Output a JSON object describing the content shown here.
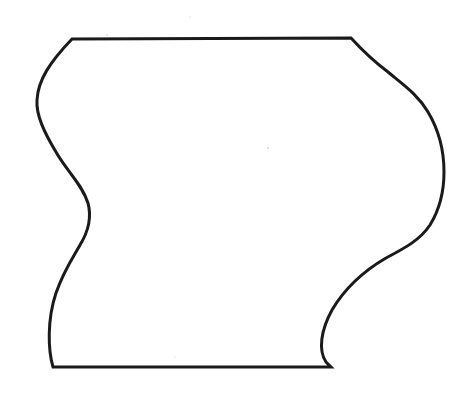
{
  "diagram": {
    "type": "outline-shape",
    "colors": {
      "background": "#ffffff",
      "stroke": "#1a1a1a",
      "specks": "#d0d0d0"
    },
    "corners": {
      "top_left": [
        72,
        39
      ],
      "top_right": [
        351,
        38
      ],
      "bottom_right": [
        331,
        367
      ],
      "bottom_left": [
        53,
        367
      ]
    }
  }
}
